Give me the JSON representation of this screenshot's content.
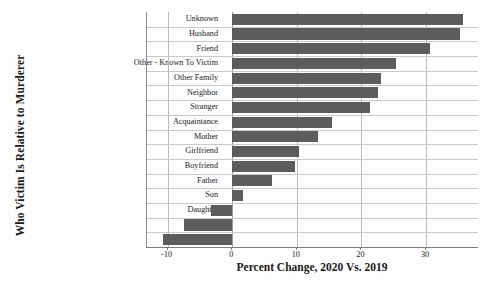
{
  "chart_data": {
    "type": "bar",
    "orientation": "horizontal",
    "title": "",
    "xlabel": "Percent Change, 2020 Vs. 2019",
    "ylabel": "Who Victim Is Relative to Murderer",
    "xlim": [
      -13.2,
      38.2
    ],
    "xticks": [
      -10,
      0,
      10,
      20,
      30
    ],
    "xticklabels": [
      "-10",
      "0",
      "10",
      "20",
      "30"
    ],
    "grid": true,
    "legend": false,
    "bar_color": "#5c5c5c",
    "categories": [
      "Unknown",
      "Husband",
      "Friend",
      "Other - Known To Victim",
      "Other Family",
      "Neighbor",
      "Stranger",
      "Acquaintance",
      "Mother",
      "Girlfriend",
      "Boyfriend",
      "Father",
      "Son",
      "Daughter",
      "Brother",
      "Wife"
    ],
    "values": [
      35.7,
      35.2,
      30.6,
      25.4,
      23.0,
      22.5,
      21.4,
      15.5,
      13.2,
      10.4,
      9.7,
      6.1,
      1.7,
      -3.3,
      -7.4,
      -10.7
    ]
  },
  "axes": {
    "y_title": "Who Victim Is Relative to Murderer",
    "x_title": "Percent Change, 2020 Vs. 2019"
  }
}
